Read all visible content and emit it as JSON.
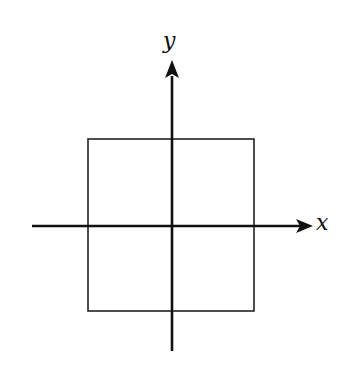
{
  "diagram": {
    "type": "coordinate-axes-with-square",
    "axes": {
      "x_label": "x",
      "y_label": "y"
    },
    "square": {
      "description": "square centered at origin",
      "left": 88,
      "top": 139,
      "right": 254,
      "bottom": 311
    },
    "colors": {
      "line": "#111111",
      "background": "#ffffff"
    }
  }
}
